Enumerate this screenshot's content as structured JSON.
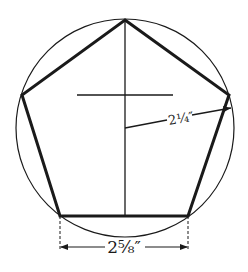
{
  "diagram": {
    "stroke_color": "#1a1a1a",
    "background": "#ffffff",
    "circle": {
      "cx": 125,
      "cy": 128,
      "r": 109
    },
    "pentagon_points": "125,20 229,95 188,216 60,216 22,95",
    "center_vertical": {
      "x1": 125,
      "y1": 20,
      "x2": 125,
      "y2": 216
    },
    "cross_horizontal": {
      "x1": 77,
      "y1": 95,
      "x2": 173,
      "y2": 95
    },
    "radius_line": {
      "x1": 125,
      "y1": 128,
      "x2": 231,
      "y2": 108
    },
    "labels": {
      "radius": "2¼″",
      "side": "2⅝″"
    }
  }
}
